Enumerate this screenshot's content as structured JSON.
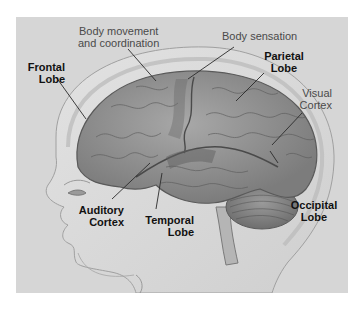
{
  "diagram": {
    "colors": {
      "panel_background": "#d6d6d6",
      "page_background": "#ffffff",
      "bold_label": "#111111",
      "light_label": "#4a4a4a",
      "leader_line": "#2a2a2a"
    },
    "labels": {
      "frontal_lobe": {
        "line1": "Frontal",
        "line2": "Lobe",
        "style": "bold"
      },
      "body_movement": {
        "line1": "Body movement",
        "line2": "and coordination",
        "style": "regular"
      },
      "body_sensation": {
        "line1": "Body sensation",
        "style": "regular"
      },
      "parietal_lobe": {
        "line1": "Parietal",
        "line2": "Lobe",
        "style": "bold"
      },
      "visual_cortex": {
        "line1": "Visual",
        "line2": "Cortex",
        "style": "regular"
      },
      "occipital_lobe": {
        "line1": "Occipital",
        "line2": "Lobe",
        "style": "bold"
      },
      "auditory_cortex": {
        "line1": "Auditory",
        "line2": "Cortex",
        "style": "bold"
      },
      "temporal_lobe": {
        "line1": "Temporal",
        "line2": "Lobe",
        "style": "bold"
      }
    }
  }
}
